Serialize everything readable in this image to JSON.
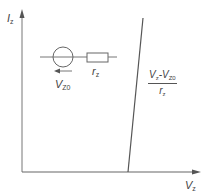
{
  "diagram": {
    "y_axis": {
      "label": "I",
      "label_sub": "z"
    },
    "x_axis": {
      "label": "V",
      "label_sub": "z"
    },
    "model": {
      "source_label": "V",
      "source_label_sub": "Z0",
      "resistor_label": "r",
      "resistor_label_sub": "z"
    },
    "slope": {
      "numerator_a": "V",
      "numerator_a_sub": "z",
      "numerator_sep": "-",
      "numerator_b": "V",
      "numerator_b_sub": "Z0",
      "denominator": "r",
      "denominator_sub": "z"
    },
    "colors": {
      "line": "#555555",
      "axis": "#666666",
      "text": "#444444"
    }
  }
}
